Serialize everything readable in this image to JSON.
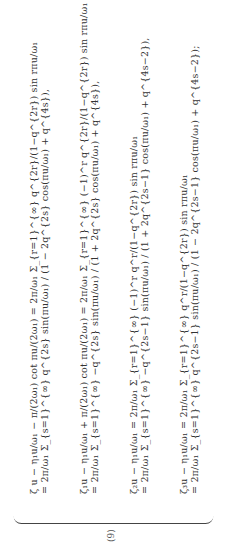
{
  "document": {
    "equation_label": "(9)",
    "equations": [
      {
        "lhs": "ζ u − η₁u/ω₁ − π/(2ω₁) cot πu/(2ω₁)",
        "mid": "= 2π/ω₁ Σ_{r=1}^{∞} q^{2r}/(1−q^{2r}) sin rπu/ω₁",
        "rhs": "= 2π/ω₁ Σ_{s=1}^{∞} q^{2s} sin(πu/ω₁) / (1 − 2q^{2s} cos(πu/ω₁) + q^{4s}),"
      },
      {
        "lhs": "ζ₁u − η₁u/ω₁ + π/(2ω₁) cot πu/(2ω₁)",
        "mid": "= 2π/ω₁ Σ_{r=1}^{∞} (−1)^r q^{2r}/(1−q^{2r}) sin rπu/ω₁",
        "rhs": "= 2π/ω₁ Σ_{s=1}^{∞} −q^{2s} sin(πu/ω₁) / (1 + 2q^{2s} cos(πu/ω₁) + q^{4s}),"
      },
      {
        "lhs": "ζ₂u − η₁u/ω₁",
        "mid": "= 2π/ω₁ Σ_{r=1}^{∞} (−1)^r q^r/(1−q^{2r}) sin rπu/ω₁",
        "rhs": "= 2π/ω₁ Σ_{s=1}^{∞} −q^{2s−1} sin(πu/ω₁) / (1 + 2q^{2s−1} cos(πu/ω₁) + q^{4s−2}),"
      },
      {
        "lhs": "ζ₃u − η₁u/ω₁",
        "mid": "= 2π/ω₁ Σ_{r=1}^{∞} q^r/(1−q^{2r}) sin rπu/ω₁",
        "rhs": "= 2π/ω₁ Σ_{s=1}^{∞} q^{2s−1} sin(πu/ω₁) / (1 − 2q^{2s−1} cos(πu/ω₁) + q^{4s−2});"
      }
    ]
  }
}
